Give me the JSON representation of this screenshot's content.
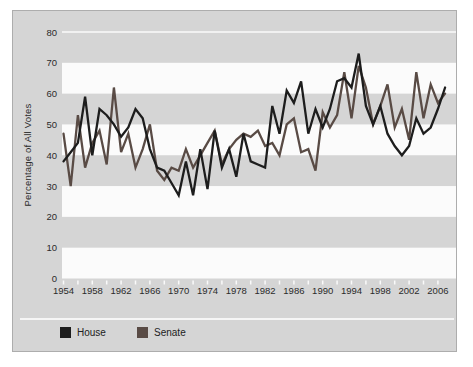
{
  "chart_data": {
    "type": "line",
    "title": "",
    "xlabel": "",
    "ylabel": "Percentage of All Votes",
    "x": [
      1954,
      1955,
      1956,
      1957,
      1958,
      1959,
      1960,
      1961,
      1962,
      1963,
      1964,
      1965,
      1966,
      1967,
      1968,
      1969,
      1970,
      1971,
      1972,
      1973,
      1974,
      1975,
      1976,
      1977,
      1978,
      1979,
      1980,
      1981,
      1982,
      1983,
      1984,
      1985,
      1986,
      1987,
      1988,
      1989,
      1990,
      1991,
      1992,
      1993,
      1994,
      1995,
      1996,
      1997,
      1998,
      1999,
      2000,
      2001,
      2002,
      2003,
      2004,
      2005,
      2006,
      2007
    ],
    "series": [
      {
        "name": "House",
        "color": "#1d1d1d",
        "values": [
          38,
          41,
          44,
          59,
          40,
          55,
          53,
          50,
          46,
          49,
          55,
          52,
          42,
          36,
          35,
          31,
          27,
          38,
          27,
          42,
          29,
          48,
          36,
          42,
          33,
          47,
          38,
          37,
          36,
          56,
          47,
          61,
          57,
          64,
          47,
          55,
          49,
          55,
          64,
          65,
          62,
          73,
          56,
          50,
          56,
          47,
          43,
          40,
          43,
          52,
          47,
          49,
          55,
          62
        ]
      },
      {
        "name": "Senate",
        "color": "#594b45",
        "values": [
          47,
          30,
          53,
          36,
          44,
          48,
          37,
          62,
          41,
          47,
          36,
          42,
          50,
          35,
          32,
          36,
          35,
          42,
          36,
          40,
          44,
          48,
          37,
          42,
          45,
          47,
          46,
          48,
          43,
          44,
          40,
          50,
          52,
          41,
          42,
          35,
          54,
          49,
          53,
          67,
          52,
          69,
          62,
          50,
          56,
          63,
          49,
          55,
          45,
          67,
          52,
          63,
          57,
          60
        ]
      }
    ],
    "ylim": [
      0,
      80
    ],
    "yticks": [
      0,
      10,
      20,
      30,
      40,
      50,
      60,
      70,
      80
    ],
    "xticks": [
      1954,
      1958,
      1962,
      1966,
      1970,
      1974,
      1978,
      1982,
      1986,
      1990,
      1994,
      1998,
      2002,
      2006
    ],
    "minor_xtick_every_years": 2,
    "grid": "alternating horizontal bands, white gridline at 80",
    "white_bands": [
      [
        0,
        10
      ],
      [
        20,
        30
      ],
      [
        40,
        50
      ],
      [
        60,
        70
      ]
    ],
    "legend_position": "bottom-left",
    "colors": {
      "page_bg": "#ffffff",
      "panel_bg": "#d5d5d5",
      "panel_border": "#adadad",
      "band_white": "#fbfbfb",
      "gridline_white": "#fafafa",
      "tick_white": "#fafafa",
      "text": "#2b2b2b"
    }
  }
}
